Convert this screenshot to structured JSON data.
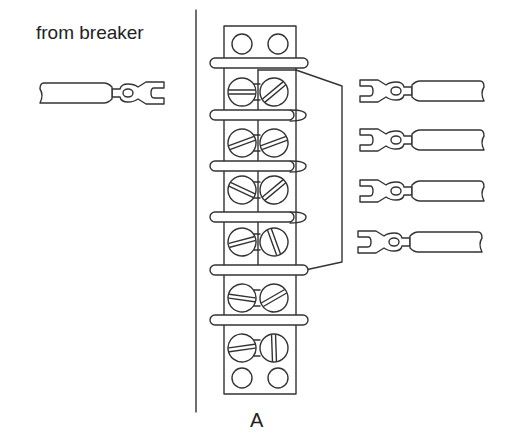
{
  "labels": {
    "source": "from breaker",
    "figure": "A"
  },
  "diagram": {
    "type": "terminal-block-wiring",
    "colors": {
      "stroke": "#333333",
      "background": "#ffffff"
    },
    "terminal_block": {
      "screw_rows": 6,
      "plain_holes": {
        "top": 2,
        "bottom": 2
      },
      "bars": 6,
      "jumpered_rows": [
        1,
        2,
        3,
        4
      ]
    },
    "connectors": {
      "input": {
        "label": "from breaker",
        "count": 1,
        "side": "left"
      },
      "outputs": {
        "count": 4,
        "side": "right"
      }
    }
  }
}
